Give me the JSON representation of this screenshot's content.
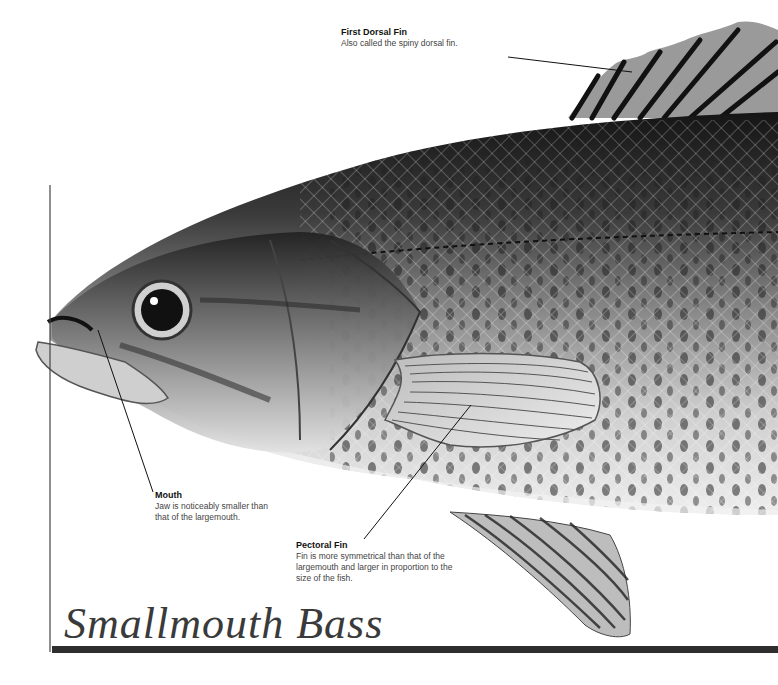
{
  "title": "Smallmouth Bass",
  "callouts": [
    {
      "id": "first-dorsal-fin",
      "title": "First Dorsal Fin",
      "desc": "Also called the spiny dorsal fin."
    },
    {
      "id": "mouth",
      "title": "Mouth",
      "desc_lines": [
        "Jaw is noticeably smaller than",
        "that of the largemouth."
      ]
    },
    {
      "id": "pectoral-fin",
      "title": "Pectoral Fin",
      "desc_lines": [
        "Fin is more symmetrical than that of the",
        "largemouth and larger in proportion to the",
        "size of the fish."
      ]
    }
  ],
  "colors": {
    "rule": "#2e2e2e",
    "title": "#3a3a3a",
    "fish_dark": "#1e1e1e",
    "fish_mid": "#7a7a7a",
    "fish_light": "#d9d9d9"
  }
}
